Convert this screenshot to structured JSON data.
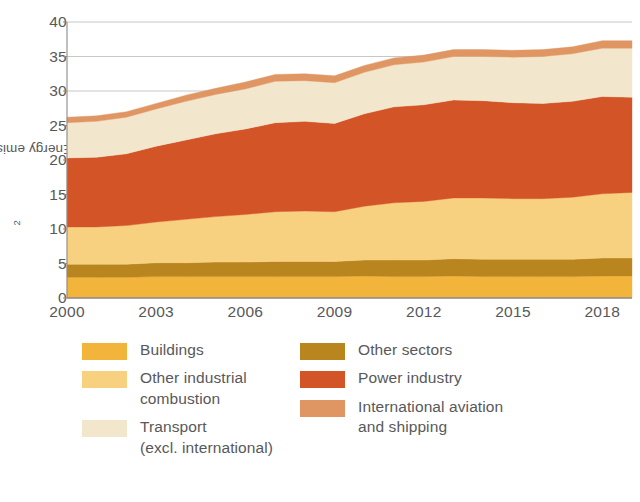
{
  "chart_data": {
    "type": "area",
    "title": "",
    "subtitle": "",
    "xlabel": "",
    "ylabel": "Energy emissions (GtCO2)",
    "ylabel_base": "Energy emissions (GtCO",
    "ylabel_sub": "2",
    "ylabel_tail": ")",
    "stacked": true,
    "grid": true,
    "grid_values": [
      30,
      35,
      40
    ],
    "legend_position": "below",
    "xlim": [
      2000,
      2019
    ],
    "ylim": [
      0,
      40
    ],
    "yticks": [
      0,
      5,
      10,
      15,
      20,
      25,
      30,
      35,
      40
    ],
    "ytick_labels": [
      "0",
      "5",
      "10",
      "15",
      "20",
      "25",
      "30",
      "35",
      "40"
    ],
    "xticks": [
      2000,
      2003,
      2006,
      2009,
      2012,
      2015,
      2018
    ],
    "xtick_labels": [
      "2000",
      "2003",
      "2006",
      "2009",
      "2012",
      "2015",
      "2018"
    ],
    "x": [
      2000,
      2001,
      2002,
      2003,
      2004,
      2005,
      2006,
      2007,
      2008,
      2009,
      2010,
      2011,
      2012,
      2013,
      2014,
      2015,
      2016,
      2017,
      2018,
      2019
    ],
    "series": [
      {
        "name": "Buildings",
        "color": "#F3B43C",
        "values": [
          3.0,
          3.0,
          3.0,
          3.1,
          3.1,
          3.1,
          3.1,
          3.1,
          3.1,
          3.1,
          3.2,
          3.1,
          3.1,
          3.2,
          3.1,
          3.1,
          3.1,
          3.1,
          3.2,
          3.2
        ]
      },
      {
        "name": "Other sectors",
        "color": "#B9851F",
        "values": [
          1.9,
          1.9,
          1.9,
          2.0,
          2.0,
          2.1,
          2.1,
          2.2,
          2.2,
          2.2,
          2.3,
          2.4,
          2.4,
          2.5,
          2.5,
          2.5,
          2.5,
          2.5,
          2.6,
          2.6
        ]
      },
      {
        "name": "Other industrial combustion",
        "color": "#F8D180",
        "values": [
          5.4,
          5.4,
          5.6,
          5.9,
          6.3,
          6.6,
          6.9,
          7.2,
          7.3,
          7.2,
          7.8,
          8.3,
          8.5,
          8.8,
          8.9,
          8.8,
          8.8,
          9.0,
          9.3,
          9.5
        ]
      },
      {
        "name": "Power industry",
        "color": "#D35426",
        "values": [
          10.0,
          10.1,
          10.4,
          11.0,
          11.5,
          12.0,
          12.4,
          12.9,
          13.0,
          12.8,
          13.4,
          13.9,
          14.0,
          14.2,
          14.1,
          13.9,
          13.8,
          13.9,
          14.1,
          13.8
        ]
      },
      {
        "name": "Transport (excl. international)",
        "color": "#F2E7CC",
        "values": [
          5.1,
          5.2,
          5.3,
          5.4,
          5.6,
          5.7,
          5.8,
          6.0,
          5.9,
          5.9,
          6.0,
          6.1,
          6.2,
          6.3,
          6.4,
          6.6,
          6.8,
          6.9,
          7.0,
          7.1
        ]
      },
      {
        "name": "International aviation and shipping",
        "color": "#E09663",
        "values": [
          0.8,
          0.8,
          0.8,
          0.8,
          0.9,
          0.9,
          1.0,
          1.0,
          1.0,
          1.0,
          1.0,
          1.0,
          1.0,
          1.0,
          1.0,
          1.0,
          1.0,
          1.0,
          1.1,
          1.1
        ]
      }
    ],
    "totals": [
      26.2,
      26.4,
      27.0,
      28.2,
      29.4,
      30.4,
      31.3,
      32.4,
      32.5,
      32.2,
      33.7,
      34.8,
      35.2,
      36.0,
      36.0,
      35.9,
      36.0,
      36.4,
      37.3,
      37.3
    ]
  },
  "legend": {
    "left_column": [
      {
        "label": "Buildings",
        "color": "#F3B43C",
        "swatch_name": "legend-swatch-buildings"
      },
      {
        "label": "Other industrial\ncombustion",
        "color": "#F8D180",
        "swatch_name": "legend-swatch-other-industrial-combustion"
      },
      {
        "label": "Transport\n(excl. international)",
        "color": "#F2E7CC",
        "swatch_name": "legend-swatch-transport"
      }
    ],
    "right_column": [
      {
        "label": "Other sectors",
        "color": "#B9851F",
        "swatch_name": "legend-swatch-other-sectors"
      },
      {
        "label": "Power industry",
        "color": "#D35426",
        "swatch_name": "legend-swatch-power-industry"
      },
      {
        "label": "International aviation\nand shipping",
        "color": "#E09663",
        "swatch_name": "legend-swatch-international-aviation"
      }
    ]
  },
  "style": {
    "axis_color": "#8b8b8e",
    "grid_color": "#b9b9bc",
    "text_color": "#58585a",
    "background": "#ffffff"
  }
}
